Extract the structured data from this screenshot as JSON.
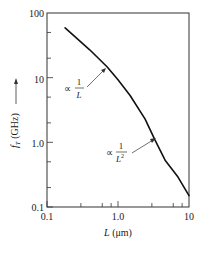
{
  "chart_data": {
    "type": "line",
    "title": "",
    "xlabel": "L (μm)",
    "ylabel": "f_T (GHz)",
    "xscale": "log",
    "yscale": "log",
    "xlim": [
      0.1,
      10
    ],
    "ylim": [
      0.1,
      100
    ],
    "x_ticks": [
      "0.1",
      "1.0",
      "10"
    ],
    "y_ticks": [
      "0.1",
      "1.0",
      "10",
      "100"
    ],
    "grid": false,
    "legend": null,
    "series": [
      {
        "name": "f_T vs L",
        "x": [
          0.18,
          0.4,
          0.7,
          1.0,
          1.48,
          2.4,
          3.3,
          4.6,
          7.0,
          10
        ],
        "y": [
          59,
          27,
          14.8,
          9.3,
          5.3,
          2.3,
          1.1,
          0.53,
          0.29,
          0.15
        ]
      }
    ],
    "annotations": [
      {
        "text": "∝ 1/L",
        "points_to": {
          "x": 0.85,
          "y": 11
        }
      },
      {
        "text": "∝ 1/L²",
        "points_to": {
          "x": 3.5,
          "y": 1.5
        }
      }
    ]
  },
  "labels": {
    "x_tick_0": "0.1",
    "x_tick_1": "1.0",
    "x_tick_2": "10",
    "y_tick_0": "0.1",
    "y_tick_1": "1.0",
    "y_tick_2": "10",
    "y_tick_3": "100",
    "xlabel_var": "L",
    "xlabel_unit": " (μm)",
    "ylabel_var": "f",
    "ylabel_sub": "T",
    "ylabel_unit": " (GHz)",
    "ann1_prop": "∝",
    "ann1_num": "1",
    "ann1_den": "L",
    "ann2_prop": "∝",
    "ann2_num": "1",
    "ann2_den": "L",
    "ann2_exp": "2"
  }
}
